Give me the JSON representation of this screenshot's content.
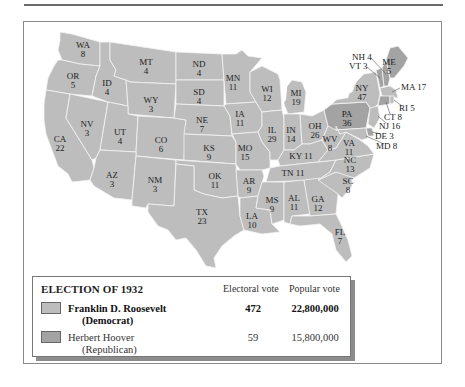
{
  "colors": {
    "democrat": "#bdbdbd",
    "republican": "#a3a3a3",
    "state_border": "#f4f4f4",
    "water": "#ffffff"
  },
  "legend": {
    "title": "ELECTION OF 1932",
    "col_electoral": "Electoral vote",
    "col_popular": "Popular vote",
    "candidates": [
      {
        "name": "Franklin D. Roosevelt",
        "party": "(Democrat)",
        "electoral": "472",
        "popular": "22,800,000",
        "winner": true
      },
      {
        "name": "Herbert Hoover",
        "party": "(Republican)",
        "electoral": "59",
        "popular": "15,800,000",
        "winner": false
      }
    ]
  },
  "states": {
    "WA": {
      "abbr": "WA",
      "ev": "8"
    },
    "OR": {
      "abbr": "OR",
      "ev": "5"
    },
    "CA": {
      "abbr": "CA",
      "ev": "22"
    },
    "NV": {
      "abbr": "NV",
      "ev": "3"
    },
    "ID": {
      "abbr": "ID",
      "ev": "4"
    },
    "MT": {
      "abbr": "MT",
      "ev": "4"
    },
    "WY": {
      "abbr": "WY",
      "ev": "3"
    },
    "UT": {
      "abbr": "UT",
      "ev": "4"
    },
    "CO": {
      "abbr": "CO",
      "ev": "6"
    },
    "AZ": {
      "abbr": "AZ",
      "ev": "3"
    },
    "NM": {
      "abbr": "NM",
      "ev": "3"
    },
    "ND": {
      "abbr": "ND",
      "ev": "4"
    },
    "SD": {
      "abbr": "SD",
      "ev": "4"
    },
    "NE": {
      "abbr": "NE",
      "ev": "7"
    },
    "KS": {
      "abbr": "KS",
      "ev": "9"
    },
    "OK": {
      "abbr": "OK",
      "ev": "11"
    },
    "TX": {
      "abbr": "TX",
      "ev": "23"
    },
    "MN": {
      "abbr": "MN",
      "ev": "11"
    },
    "IA": {
      "abbr": "IA",
      "ev": "11"
    },
    "MO": {
      "abbr": "MO",
      "ev": "15"
    },
    "AR": {
      "abbr": "AR",
      "ev": "9"
    },
    "LA": {
      "abbr": "LA",
      "ev": "10"
    },
    "WI": {
      "abbr": "WI",
      "ev": "12"
    },
    "MI": {
      "abbr": "MI",
      "ev": "19"
    },
    "IL": {
      "abbr": "IL",
      "ev": "29"
    },
    "IN": {
      "abbr": "IN",
      "ev": "14"
    },
    "OH": {
      "abbr": "OH",
      "ev": "26"
    },
    "KY": {
      "abbr": "KY",
      "ev": "11"
    },
    "TN": {
      "abbr": "TN",
      "ev": "11"
    },
    "MS": {
      "abbr": "MS",
      "ev": "9"
    },
    "AL": {
      "abbr": "AL",
      "ev": "11"
    },
    "GA": {
      "abbr": "GA",
      "ev": "12"
    },
    "FL": {
      "abbr": "FL",
      "ev": "7"
    },
    "SC": {
      "abbr": "SC",
      "ev": "8"
    },
    "NC": {
      "abbr": "NC",
      "ev": "13"
    },
    "VA": {
      "abbr": "VA",
      "ev": "11"
    },
    "WV": {
      "abbr": "WV",
      "ev": "8"
    },
    "PA": {
      "abbr": "PA",
      "ev": "36"
    },
    "NY": {
      "abbr": "NY",
      "ev": "47"
    },
    "ME": {
      "abbr": "ME",
      "ev": "5"
    }
  },
  "callouts": {
    "NH": "NH 4",
    "VT": "VT 3",
    "MA": "MA 17",
    "RI": "RI 5",
    "CT": "CT 8",
    "NJ": "NJ 16",
    "DE": "DE 3",
    "MD": "MD 8"
  },
  "hoover_states": [
    "PA",
    "ME",
    "VT",
    "NH",
    "CT",
    "DE"
  ]
}
